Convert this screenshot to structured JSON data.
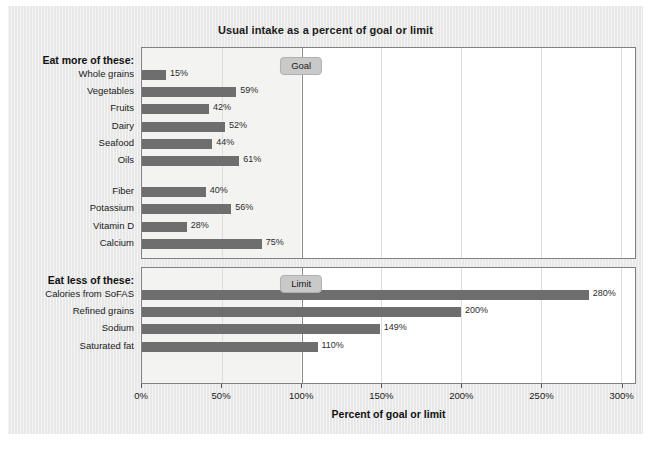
{
  "chart_data": {
    "type": "bar",
    "orientation": "horizontal",
    "title": "Usual intake as a percent of goal or limit",
    "xlabel": "Percent of goal or limit",
    "ylabel": "",
    "xlim": [
      0,
      309
    ],
    "xticks": [
      0,
      50,
      100,
      150,
      200,
      250,
      300
    ],
    "xtick_labels": [
      "0%",
      "50%",
      "100%",
      "150%",
      "200%",
      "250%",
      "300%"
    ],
    "grid": true,
    "legend": "none",
    "reference_line": 100,
    "panels": [
      {
        "header": "Eat more of these:",
        "reference_label": "Goal",
        "categories": [
          "Whole grains",
          "Vegetables",
          "Fruits",
          "Dairy",
          "Seafood",
          "Oils",
          "Fiber",
          "Potassium",
          "Vitamin D",
          "Calcium"
        ],
        "values": [
          15,
          59,
          42,
          52,
          44,
          61,
          40,
          56,
          28,
          75
        ],
        "value_labels": [
          "15%",
          "59%",
          "42%",
          "52%",
          "44%",
          "61%",
          "40%",
          "56%",
          "28%",
          "75%"
        ],
        "gap_after_index": 5
      },
      {
        "header": "Eat less of these:",
        "reference_label": "Limit",
        "categories": [
          "Calories from SoFAS",
          "Refined grains",
          "Sodium",
          "Saturated fat"
        ],
        "values": [
          280,
          200,
          149,
          110
        ],
        "value_labels": [
          "280%",
          "200%",
          "149%",
          "110%"
        ],
        "gap_after_index": -1
      }
    ],
    "colors": {
      "bar": "#6e6e6e",
      "panel_background": "#ffffff",
      "shaded_region": "#f3f3f1",
      "figure_background": "#e8e8e8",
      "reference_line": "#8a8a8a",
      "badge": "#c9c9c9",
      "gridline": "#dddddd",
      "text": "#1a1a1a"
    }
  }
}
